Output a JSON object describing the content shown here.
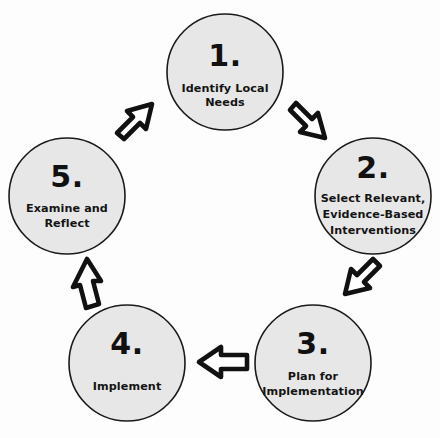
{
  "diagram": {
    "type": "circular-process-cycle",
    "direction": "clockwise",
    "colors": {
      "node_fill": "#e7e7e7",
      "node_stroke": "#1a1a1a",
      "arrow_fill": "#ffffff",
      "arrow_stroke": "#111111",
      "background": "#fdfdfd",
      "text": "#141414"
    },
    "nodes": [
      {
        "number": "1.",
        "label_line1": "Identify Local",
        "label_line2": "Needs",
        "cx": 225,
        "cy": 72,
        "r": 58
      },
      {
        "number": "2.",
        "label_line1": "Select Relevant,",
        "label_line2": "Evidence-Based",
        "label_line3": "Interventions",
        "cx": 373,
        "cy": 196,
        "r": 58
      },
      {
        "number": "3.",
        "label_line1": "Plan for",
        "label_line2": "Implementation",
        "cx": 313,
        "cy": 363,
        "r": 58
      },
      {
        "number": "4.",
        "label_line1": "Implement",
        "cx": 127,
        "cy": 363,
        "r": 58
      },
      {
        "number": "5.",
        "label_line1": "Examine and",
        "label_line2": "Reflect",
        "cx": 67,
        "cy": 196,
        "r": 58
      }
    ],
    "arrows": [
      {
        "from": "1",
        "to": "2",
        "direction": "southeast"
      },
      {
        "from": "2",
        "to": "3",
        "direction": "southwest"
      },
      {
        "from": "3",
        "to": "4",
        "direction": "west"
      },
      {
        "from": "4",
        "to": "5",
        "direction": "north"
      },
      {
        "from": "5",
        "to": "1",
        "direction": "northeast"
      }
    ]
  }
}
